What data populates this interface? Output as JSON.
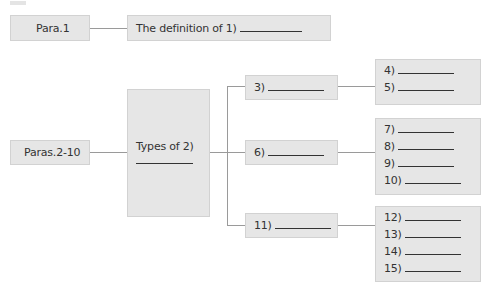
{
  "row1": {
    "section_label": "Para.1",
    "definition_prefix": "The definition of 1)"
  },
  "row2": {
    "section_label": "Paras.2-10",
    "types_prefix": "Types of 2)",
    "branches": [
      {
        "label": "3)",
        "items": [
          "4)",
          "5)"
        ]
      },
      {
        "label": "6)",
        "items": [
          "7)",
          "8)",
          "9)",
          "10)"
        ]
      },
      {
        "label": "11)",
        "items": [
          "12)",
          "13)",
          "14)",
          "15)"
        ]
      }
    ]
  },
  "colors": {
    "box_fill": "#e6e6e6",
    "line": "#9a9a9a",
    "text": "#333333"
  }
}
